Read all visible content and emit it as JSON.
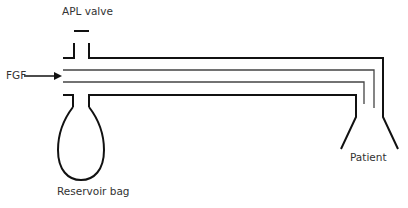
{
  "diagram": {
    "labels": {
      "apl_valve": "APL valve",
      "fgf": "FGF",
      "reservoir_bag": "Reservoir bag",
      "patient": "Patient"
    },
    "colors": {
      "stroke": "#111111",
      "inner_stroke": "#555555",
      "text": "#333333",
      "background": "#ffffff"
    }
  }
}
